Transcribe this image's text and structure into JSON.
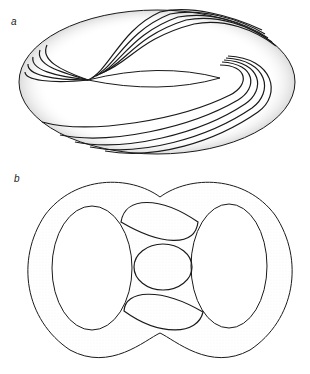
{
  "panels": [
    {
      "label": "a",
      "description": "Torus with helical curves wrapping around surface"
    },
    {
      "label": "b",
      "description": "Double torus (genus-2 surface) with closed curves around handles and central lens loops"
    }
  ],
  "colors": {
    "line": "#1a1a1a",
    "stipple": "#555555",
    "background": "#ffffff"
  }
}
